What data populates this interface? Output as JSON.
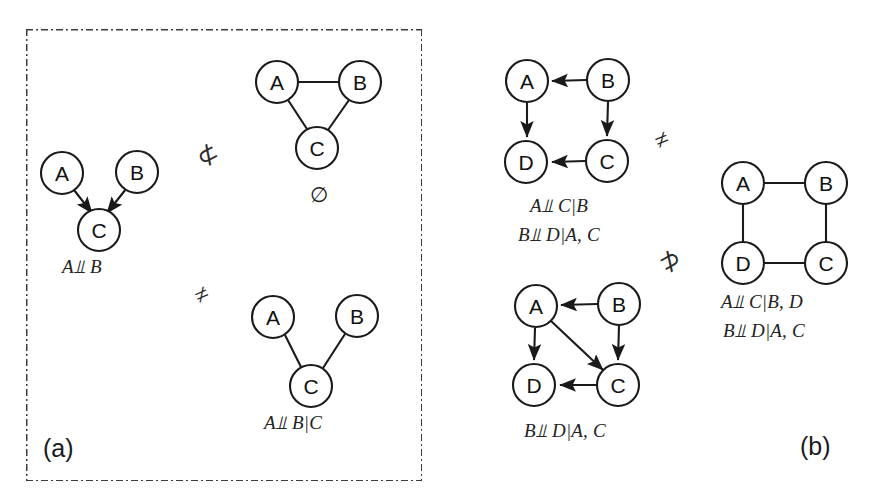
{
  "figure": {
    "background": "#ffffff",
    "stroke_color": "#1a1a1a",
    "border_color": "#3b3b3b",
    "width": 875,
    "height": 504
  },
  "panels": [
    {
      "tag": "(a)",
      "id": "panel-a",
      "graphs": [
        {
          "id": "a-collider-dag",
          "type": "directed",
          "nodes": [
            {
              "label": "A",
              "x": 62,
              "y": 173
            },
            {
              "label": "B",
              "x": 137,
              "y": 172
            },
            {
              "label": "C",
              "x": 99,
              "y": 230
            }
          ],
          "edges": [
            {
              "from": "A",
              "to": "C",
              "arrow": true
            },
            {
              "from": "B",
              "to": "C",
              "arrow": true
            }
          ],
          "caption": "A⫫B"
        },
        {
          "id": "a-triangle-ug",
          "type": "undirected",
          "nodes": [
            {
              "label": "A",
              "x": 277,
              "y": 82
            },
            {
              "label": "B",
              "x": 360,
              "y": 82
            },
            {
              "label": "C",
              "x": 317,
              "y": 148
            }
          ],
          "edges": [
            {
              "from": "A",
              "to": "B",
              "arrow": false
            },
            {
              "from": "A",
              "to": "C",
              "arrow": false
            },
            {
              "from": "B",
              "to": "C",
              "arrow": false
            }
          ],
          "caption": "∅"
        },
        {
          "id": "a-vstructure-ug",
          "type": "undirected",
          "nodes": [
            {
              "label": "A",
              "x": 273,
              "y": 317
            },
            {
              "label": "B",
              "x": 357,
              "y": 316
            },
            {
              "label": "C",
              "x": 311,
              "y": 386
            }
          ],
          "edges": [
            {
              "from": "A",
              "to": "C",
              "arrow": false
            },
            {
              "from": "B",
              "to": "C",
              "arrow": false
            }
          ],
          "caption": "A⫫B|C"
        }
      ],
      "relations": [
        {
          "symbol": "⊄",
          "name": "not-subset-symbol",
          "x": 197,
          "y": 147
        },
        {
          "symbol": "≠",
          "name": "not-equal-symbol",
          "x": 195,
          "y": 287
        }
      ]
    },
    {
      "tag": "(b)",
      "id": "panel-b",
      "graphs": [
        {
          "id": "b-square-dag",
          "type": "directed",
          "nodes": [
            {
              "label": "A",
              "x": 527,
              "y": 81
            },
            {
              "label": "B",
              "x": 608,
              "y": 80
            },
            {
              "label": "D",
              "x": 526,
              "y": 162
            },
            {
              "label": "C",
              "x": 607,
              "y": 161
            }
          ],
          "edges": [
            {
              "from": "B",
              "to": "A",
              "arrow": true
            },
            {
              "from": "A",
              "to": "D",
              "arrow": true
            },
            {
              "from": "B",
              "to": "C",
              "arrow": true
            },
            {
              "from": "C",
              "to": "D",
              "arrow": true
            }
          ],
          "captions": [
            "A⫫C|B",
            "B⫫D|A, C"
          ]
        },
        {
          "id": "b-moral-dag",
          "type": "directed",
          "nodes": [
            {
              "label": "A",
              "x": 536,
              "y": 306
            },
            {
              "label": "B",
              "x": 619,
              "y": 304
            },
            {
              "label": "D",
              "x": 534,
              "y": 385
            },
            {
              "label": "C",
              "x": 618,
              "y": 385
            }
          ],
          "edges": [
            {
              "from": "B",
              "to": "A",
              "arrow": true
            },
            {
              "from": "A",
              "to": "D",
              "arrow": true
            },
            {
              "from": "B",
              "to": "C",
              "arrow": true
            },
            {
              "from": "A",
              "to": "C",
              "arrow": true
            },
            {
              "from": "C",
              "to": "D",
              "arrow": true
            }
          ],
          "captions": [
            "B⫫D|A, C"
          ]
        },
        {
          "id": "b-square-ug",
          "type": "undirected",
          "nodes": [
            {
              "label": "A",
              "x": 743,
              "y": 183
            },
            {
              "label": "B",
              "x": 826,
              "y": 183
            },
            {
              "label": "D",
              "x": 743,
              "y": 263
            },
            {
              "label": "C",
              "x": 826,
              "y": 263
            }
          ],
          "edges": [
            {
              "from": "A",
              "to": "B",
              "arrow": false
            },
            {
              "from": "A",
              "to": "D",
              "arrow": false
            },
            {
              "from": "B",
              "to": "C",
              "arrow": false
            },
            {
              "from": "D",
              "to": "C",
              "arrow": false
            }
          ],
          "captions": [
            "A⫫C|B, D",
            "B⫫D|A, C"
          ]
        }
      ],
      "relations": [
        {
          "symbol": "≠",
          "name": "not-equal-symbol",
          "x": 655,
          "y": 133
        },
        {
          "symbol": "⊅",
          "name": "not-superset-symbol",
          "x": 659,
          "y": 253
        }
      ]
    }
  ],
  "captions": {
    "a_collider": "A⫫ B",
    "a_triangle": "∅",
    "a_vstructure": "A⫫ B|C",
    "b_square_dag_1": "A⫫ C|B",
    "b_square_dag_2": "B⫫ D|A, C",
    "b_moral_dag_1": "B⫫ D|A, C",
    "b_square_ug_1": "A⫫ C|B, D",
    "b_square_ug_2": "B⫫ D|A, C",
    "panel_a_tag": "(a)",
    "panel_b_tag": "(b)"
  },
  "relation_symbols": {
    "a_top": "⊄",
    "a_bottom": "≠",
    "b_top": "≠",
    "b_bottom": "⊅"
  }
}
